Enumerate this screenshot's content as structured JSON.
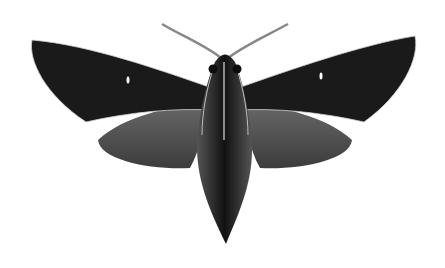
{
  "image": {
    "subject": "moth illustration",
    "description": "Dorsal view of a dark hawk moth with spread wings on white background",
    "colors": {
      "background": "#ffffff",
      "forewing": "#1a1a1a",
      "hindwing": "#555555",
      "body": "#141414",
      "highlight": "#e8e8e8"
    }
  }
}
